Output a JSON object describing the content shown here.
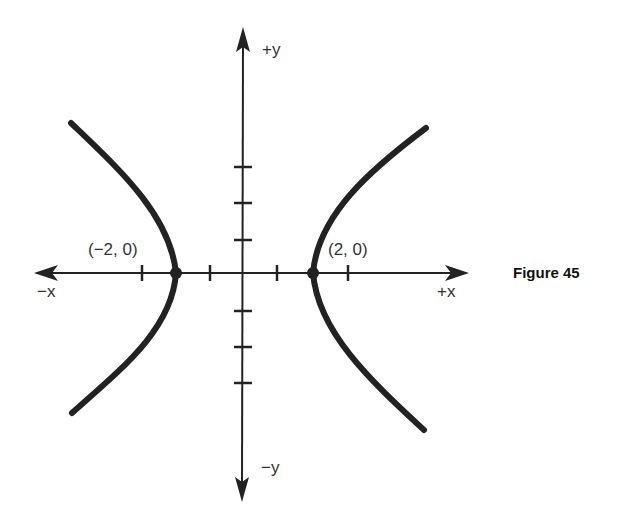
{
  "figure": {
    "caption": "Figure 45",
    "axes": {
      "x_pos_label": "+x",
      "x_neg_label": "−x",
      "y_pos_label": "+y",
      "y_neg_label": "−y"
    },
    "points": [
      {
        "label": "(−2, 0)",
        "x": -2,
        "y": 0
      },
      {
        "label": "(2, 0)",
        "x": 2,
        "y": 0
      }
    ],
    "curve": "hyperbola with vertices at (−2, 0) and (2, 0), opening left and right",
    "tick_marks": {
      "x": [
        -3,
        -1,
        1,
        3
      ],
      "y": [
        -3,
        -2,
        -1,
        1,
        2,
        3
      ]
    },
    "colors": {
      "ink": "#222222",
      "background": "#ffffff"
    }
  }
}
